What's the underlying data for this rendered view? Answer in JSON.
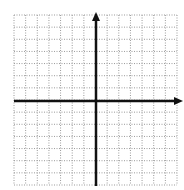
{
  "diagram": {
    "type": "coordinate-grid",
    "grid": {
      "columns": 14,
      "rows": 14,
      "left": 14,
      "top": 15,
      "right": 177,
      "bottom": 185,
      "line_style": "dotted",
      "line_color": "#9a9a9a"
    },
    "axes": {
      "color": "#111111",
      "x_axis": {
        "y": 101,
        "x_start": 14,
        "x_end": 183,
        "arrow": "right"
      },
      "y_axis": {
        "x": 96,
        "y_start": 186,
        "y_end": 12,
        "arrow": "up"
      }
    },
    "labels": []
  }
}
